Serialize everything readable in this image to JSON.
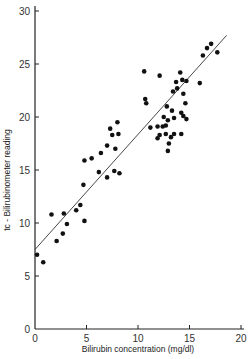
{
  "chart_data": {
    "type": "scatter",
    "title": "",
    "xlabel": "Bilirubin concentration (mg/dl)",
    "ylabel": "tc - Bilirubinometer reading",
    "xlim": [
      0,
      20
    ],
    "ylim": [
      0,
      30
    ],
    "xticks": [
      0,
      5,
      10,
      15,
      20
    ],
    "yticks": [
      0,
      5,
      10,
      15,
      20,
      25,
      30
    ],
    "xtick_labels": [
      "0",
      "5",
      "10",
      "15",
      "20"
    ],
    "ytick_labels": [
      "0",
      "5",
      "10",
      "15",
      "20",
      "25",
      "30"
    ],
    "grid": false,
    "legend": null,
    "regression_line": {
      "x": [
        0,
        18.6
      ],
      "y": [
        7.5,
        27.7
      ]
    },
    "series": [
      {
        "name": "measurements",
        "points": [
          [
            0.2,
            7.0
          ],
          [
            0.8,
            6.3
          ],
          [
            1.6,
            10.8
          ],
          [
            2.1,
            8.3
          ],
          [
            2.7,
            9.0
          ],
          [
            2.8,
            10.9
          ],
          [
            3.1,
            9.9
          ],
          [
            4.0,
            11.2
          ],
          [
            4.4,
            11.7
          ],
          [
            4.7,
            13.6
          ],
          [
            4.8,
            10.2
          ],
          [
            4.8,
            15.9
          ],
          [
            5.5,
            16.1
          ],
          [
            6.2,
            14.8
          ],
          [
            6.4,
            16.6
          ],
          [
            7.0,
            17.3
          ],
          [
            7.0,
            14.3
          ],
          [
            7.3,
            18.9
          ],
          [
            7.5,
            18.3
          ],
          [
            7.7,
            14.9
          ],
          [
            7.8,
            17.0
          ],
          [
            8.0,
            19.5
          ],
          [
            8.2,
            14.7
          ],
          [
            8.1,
            18.4
          ],
          [
            10.6,
            24.3
          ],
          [
            12.1,
            23.9
          ],
          [
            10.7,
            21.7
          ],
          [
            10.8,
            21.3
          ],
          [
            11.2,
            19.0
          ],
          [
            11.9,
            18.0
          ],
          [
            11.9,
            19.1
          ],
          [
            12.4,
            19.1
          ],
          [
            12.7,
            19.2
          ],
          [
            12.5,
            20.0
          ],
          [
            12.8,
            21.0
          ],
          [
            12.9,
            19.7
          ],
          [
            13.2,
            18.1
          ],
          [
            13.5,
            18.4
          ],
          [
            13.5,
            19.9
          ],
          [
            13.3,
            20.6
          ],
          [
            13.4,
            22.4
          ],
          [
            13.8,
            22.7
          ],
          [
            13.7,
            23.3
          ],
          [
            14.3,
            23.5
          ],
          [
            14.1,
            24.2
          ],
          [
            14.7,
            23.4
          ],
          [
            14.4,
            22.2
          ],
          [
            14.6,
            21.3
          ],
          [
            14.2,
            20.4
          ],
          [
            14.4,
            20.1
          ],
          [
            14.2,
            18.4
          ],
          [
            14.7,
            19.8
          ],
          [
            16.0,
            23.2
          ],
          [
            16.3,
            25.8
          ],
          [
            16.7,
            26.5
          ],
          [
            17.1,
            26.9
          ],
          [
            17.7,
            26.1
          ],
          [
            12.7,
            18.4
          ],
          [
            12.9,
            16.8
          ],
          [
            13.0,
            17.5
          ],
          [
            12.1,
            18.3
          ]
        ]
      }
    ]
  },
  "colors": {
    "ink": "#111111",
    "axis": "#222222",
    "background": "#ffffff"
  }
}
